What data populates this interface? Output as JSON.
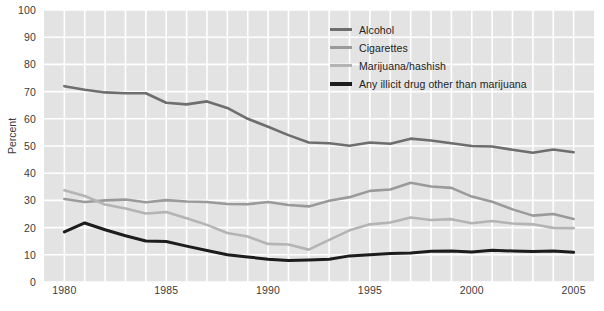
{
  "chart_data": {
    "type": "line",
    "title": "",
    "xlabel": "",
    "ylabel": "Percent",
    "xlim": [
      1979,
      2006
    ],
    "ylim": [
      0,
      100
    ],
    "grid": true,
    "legend_position": "top-right",
    "x": [
      1980,
      1981,
      1982,
      1983,
      1984,
      1985,
      1986,
      1987,
      1988,
      1989,
      1990,
      1991,
      1992,
      1993,
      1994,
      1995,
      1996,
      1997,
      1998,
      1999,
      2000,
      2001,
      2002,
      2003,
      2004,
      2005
    ],
    "xticks": [
      "1980",
      "1985",
      "1990",
      "1995",
      "2000",
      "2005"
    ],
    "xtick_values": [
      1980,
      1985,
      1990,
      1995,
      2000,
      2005
    ],
    "yticks": [
      "0",
      "10",
      "20",
      "30",
      "40",
      "50",
      "60",
      "70",
      "80",
      "90",
      "100"
    ],
    "ytick_values": [
      0,
      10,
      20,
      30,
      40,
      50,
      60,
      70,
      80,
      90,
      100
    ],
    "series": [
      {
        "name": "Alcohol",
        "color": "#6e6e6e",
        "width": 2.6,
        "values": [
          72.0,
          70.7,
          69.7,
          69.4,
          69.4,
          65.9,
          65.3,
          66.4,
          64.0,
          60.0,
          57.1,
          54.0,
          51.3,
          51.0,
          50.1,
          51.3,
          50.8,
          52.7,
          52.0,
          51.0,
          50.0,
          49.8,
          48.6,
          47.5,
          48.7,
          47.7
        ]
      },
      {
        "name": "Cigarettes",
        "color": "#9a9a9a",
        "width": 2.6,
        "values": [
          30.5,
          29.4,
          30.0,
          30.3,
          29.3,
          30.1,
          29.6,
          29.4,
          28.7,
          28.6,
          29.4,
          28.3,
          27.8,
          29.9,
          31.2,
          33.5,
          34.0,
          36.5,
          35.1,
          34.6,
          31.4,
          29.5,
          26.7,
          24.4,
          25.0,
          23.2
        ]
      },
      {
        "name": "Marijuana/hashish",
        "color": "#b4b4b4",
        "width": 2.6,
        "values": [
          33.7,
          31.6,
          28.5,
          27.0,
          25.2,
          25.7,
          23.4,
          21.0,
          18.0,
          16.7,
          14.0,
          13.8,
          11.9,
          15.5,
          19.0,
          21.2,
          21.9,
          23.7,
          22.8,
          23.1,
          21.6,
          22.4,
          21.5,
          21.2,
          19.9,
          19.8
        ]
      },
      {
        "name": "Any illicit drug other than marijuana",
        "color": "#1c1c1c",
        "width": 3.0,
        "values": [
          18.4,
          21.7,
          19.2,
          17.0,
          15.1,
          14.9,
          13.2,
          11.6,
          10.0,
          9.2,
          8.4,
          7.9,
          8.1,
          8.4,
          9.6,
          10.0,
          10.5,
          10.7,
          11.3,
          11.4,
          11.0,
          11.7,
          11.4,
          11.2,
          11.4,
          10.9
        ]
      }
    ]
  },
  "axes": {
    "y_title": "Percent"
  },
  "legend": {
    "items": [
      {
        "label": "Alcohol",
        "color": "#6e6e6e",
        "thickness": 3
      },
      {
        "label": "Cigarettes",
        "color": "#9a9a9a",
        "thickness": 3
      },
      {
        "label": "Marijuana/hashish",
        "color": "#b4b4b4",
        "thickness": 3
      },
      {
        "label": "Any illicit drug other than marijuana",
        "color": "#1c1c1c",
        "thickness": 4
      }
    ]
  },
  "style": {
    "plot_background": "#e3e3e3",
    "gridline_color": "#ffffff",
    "page_background": "#ffffff",
    "text_color": "#3b3b3b"
  }
}
